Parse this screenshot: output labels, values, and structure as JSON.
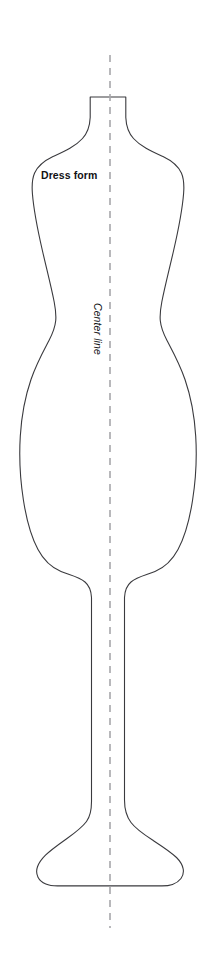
{
  "diagram": {
    "background_color": "#ffffff",
    "width": 213,
    "height": 971,
    "outline_color": "#3a3a3e",
    "center_line_color": "#a7a7ab",
    "labels": {
      "dress_form": "Dress form",
      "center_line": "Center line"
    },
    "shapes": {
      "form_path": "M 94.2 97.0 L 125.8 97.0 L 125.8 117.5 C 126.2 126.5 128.5 133.0 133.5 138.5 C 141.0 146.8 152.0 151.5 163.0 156.5 C 171.5 160.6 178.0 165.5 181.4 173.0 C 184.0 179.0 184.2 186.0 183.6 193.5 C 182.2 211.0 178.0 231.5 173.5 251.0 C 169.0 270.5 164.5 288.0 161.8 302.0 C 160.3 309.8 159.8 315.6 160.3 320.8 C 161.0 328.0 163.5 333.8 167.0 340.5 C 172.5 351.0 179.5 363.5 185.0 379.5 C 190.5 395.5 194.4 415.0 195.7 436.0 C 197.0 457.0 195.8 479.5 192.6 500.0 C 189.5 520.0 184.5 537.5 178.0 549.5 C 172.0 560.8 164.5 567.5 155.0 571.5 C 147.0 575.0 137.5 576.5 131.0 582.0 C 126.5 585.8 124.8 591.0 124.5 597.5 L 124.5 800.0 C 124.5 810.0 126.5 816.5 131.0 822.5 C 136.0 829.2 144.0 834.5 152.5 840.0 C 162.0 846.2 171.0 852.0 176.5 857.5 C 180.5 861.5 182.5 865.2 183.2 869.0 C 183.8 872.5 183.0 875.8 181.0 878.5 C 179.0 881.2 176.0 883.2 172.5 884.4 C 169.5 885.5 166.0 885.9 162.0 885.9 L 57.5 885.9 C 53.0 885.9 49.0 885.4 45.8 884.0 C 42.2 882.5 39.5 880.2 38.0 877.2 C 36.4 874.0 36.2 870.4 37.5 866.8 C 38.8 863.0 41.5 859.2 45.5 855.2 C 51.0 849.7 59.0 844.2 67.0 838.5 C 75.0 832.8 82.0 827.6 86.5 821.5 C 90.2 816.4 91.5 810.5 91.5 801.5 L 91.5 597.5 C 91.2 591.0 89.5 585.8 85.0 582.0 C 78.5 576.5 69.0 575.0 61.0 571.5 C 51.5 567.5 44.0 560.8 38.0 549.5 C 31.5 537.5 26.5 520.0 23.4 500.0 C 20.2 479.5 19.0 457.0 20.3 436.0 C 21.6 415.0 25.5 395.5 31.0 379.5 C 36.5 363.5 43.5 351.0 49.0 340.5 C 52.5 333.8 55.0 328.0 55.7 320.8 C 56.2 315.6 55.7 309.8 54.2 302.0 C 51.5 288.0 47.0 270.5 42.5 251.0 C 38.0 231.5 33.8 211.0 32.4 193.5 C 31.8 186.0 32.0 179.0 34.6 173.0 C 38.0 165.5 44.5 160.6 53.0 156.5 C 64.0 151.5 75.0 146.8 82.5 138.5 C 87.5 133.0 89.8 126.5 90.2 117.5 L 90.2 97.0 Z",
      "center_line_x": 110,
      "center_line_y_start": 55,
      "center_line_y_end": 928
    }
  }
}
